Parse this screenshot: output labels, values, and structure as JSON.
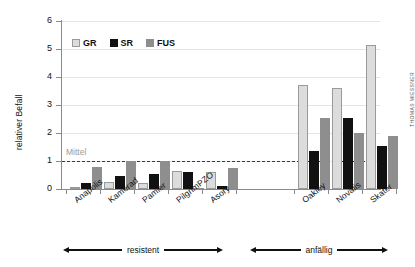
{
  "chart_data": {
    "type": "bar",
    "title": "",
    "xlabel": "",
    "ylabel": "relativer Befall",
    "ylim": [
      0,
      6
    ],
    "yticks": [
      0,
      1,
      2,
      3,
      4,
      5,
      6
    ],
    "grid": true,
    "legend_position": "top-left",
    "categories": [
      "Anapolis",
      "Kamerad",
      "Pamier",
      "PilgrimPZO",
      "Asory",
      "Oakley",
      "Novalis",
      "Skater"
    ],
    "series": [
      {
        "name": "GR",
        "color": "#dcdcdc",
        "values": [
          0.05,
          0.25,
          0.2,
          0.65,
          0.6,
          3.7,
          3.6,
          5.15
        ]
      },
      {
        "name": "SR",
        "color": "#111111",
        "values": [
          0.2,
          0.45,
          0.55,
          0.6,
          0.1,
          1.35,
          2.55,
          1.55
        ]
      },
      {
        "name": "FUS",
        "color": "#8e8e8e",
        "values": [
          0.8,
          1.0,
          1.0,
          0.05,
          0.75,
          2.55,
          2.0,
          1.9
        ]
      }
    ],
    "reference_line": {
      "value": 1,
      "label": "Mittel",
      "style": "dashed"
    },
    "annotations": [
      {
        "label": "resistent",
        "covers": [
          "Anapolis",
          "Kamerad",
          "Pamier",
          "PilgrimPZO",
          "Asory"
        ]
      },
      {
        "label": "anfällig",
        "covers": [
          "Oakley",
          "Novalis",
          "Skater"
        ]
      }
    ],
    "credit": "THOMAS MIESSNER"
  }
}
